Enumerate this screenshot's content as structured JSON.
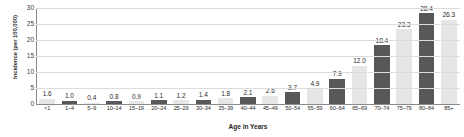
{
  "chart_data": {
    "type": "bar",
    "title": "",
    "xlabel": "Age in Years",
    "ylabel": "Incidence (per 100,000)",
    "categories": [
      "<1",
      "1–4",
      "5–9",
      "10–14",
      "15–19",
      "20–24",
      "25–29",
      "30–34",
      "35–39",
      "40–44",
      "45–49",
      "50–54",
      "55–59",
      "60–64",
      "65–69",
      "70–74",
      "75–79",
      "80–84",
      "85+"
    ],
    "values": [
      1.6,
      1.0,
      0.4,
      0.8,
      0.9,
      1.1,
      1.2,
      1.4,
      1.8,
      2.1,
      2.6,
      3.7,
      4.9,
      7.9,
      12.0,
      18.4,
      23.3,
      28.4,
      26.3
    ],
    "value_labels": [
      "1.6",
      "1.0",
      "0.4",
      "0.8",
      "0.9",
      "1.1",
      "1.2",
      "1.4",
      "1.8",
      "2.1",
      "2.6",
      "3.7",
      "4.9",
      "7.9",
      "12.0",
      "18.4",
      "23.3",
      "28.4",
      "26.3"
    ],
    "bar_shades": [
      "light",
      "dark",
      "light",
      "dark",
      "light",
      "dark",
      "light",
      "dark",
      "light",
      "dark",
      "light",
      "dark",
      "light",
      "dark",
      "light",
      "dark",
      "light",
      "dark",
      "light"
    ],
    "ylim": [
      0,
      30
    ],
    "yticks": [
      0,
      5,
      10,
      15,
      20,
      25,
      30
    ],
    "ytick_labels": [
      "0",
      "5",
      "10",
      "15",
      "20",
      "25",
      "30"
    ],
    "grid": true,
    "legend": "none",
    "colors": {
      "bar_dark": "#58585a",
      "bar_light": "#e6e6e6",
      "gridline": "#dcdcdc",
      "axis": "#8a8a8a",
      "text": "#2b2b2b"
    }
  }
}
